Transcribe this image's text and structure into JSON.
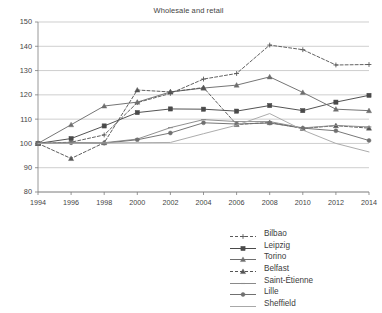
{
  "chart_data": {
    "type": "line",
    "title": "Wholesale and retail",
    "xlabel": "",
    "ylabel": "",
    "x": [
      1994,
      1996,
      1998,
      2000,
      2002,
      2004,
      2006,
      2008,
      2010,
      2012,
      2014
    ],
    "xtick_labels": [
      "1994",
      "1996",
      "1998",
      "2000",
      "2002",
      "2004",
      "2006",
      "2008",
      "2010",
      "2012",
      "2014"
    ],
    "ytick_labels": [
      "80",
      "90",
      "100",
      "110",
      "120",
      "130",
      "140",
      "150"
    ],
    "yticks": [
      80,
      90,
      100,
      110,
      120,
      130,
      140,
      150
    ],
    "ylim": [
      80,
      150
    ],
    "xlim": [
      1994,
      2014
    ],
    "grid": true,
    "legend_position": "bottom-right",
    "series": [
      {
        "name": "Bilbao",
        "color": "#5a5a5a",
        "dash": "3,2",
        "marker": "plus",
        "values": [
          100.0,
          100.5,
          103.5,
          116.8,
          120.6,
          126.5,
          128.8,
          140.5,
          138.6,
          132.3,
          132.5
        ]
      },
      {
        "name": "Leipzig",
        "color": "#4a4a4a",
        "dash": "none",
        "marker": "square",
        "values": [
          100.0,
          102.0,
          107.2,
          112.7,
          114.2,
          114.1,
          113.3,
          115.6,
          113.5,
          117.0,
          119.8
        ]
      },
      {
        "name": "Torino",
        "color": "#6e6e6e",
        "dash": "none",
        "marker": "triangle",
        "values": [
          100.0,
          107.7,
          115.4,
          117.0,
          121.2,
          122.8,
          124.0,
          127.4,
          121.0,
          114.1,
          113.5
        ]
      },
      {
        "name": "Belfast",
        "color": "#555555",
        "dash": "3,2",
        "marker": "triangle",
        "values": [
          100.0,
          93.8,
          100.3,
          122.0,
          121.2,
          123.0,
          107.8,
          108.6,
          106.2,
          107.3,
          106.3
        ]
      },
      {
        "name": "Saint-Étienne",
        "color": "#8a8a8a",
        "dash": "none",
        "marker": "dash",
        "values": [
          100.0,
          100.2,
          100.3,
          101.8,
          106.5,
          109.8,
          109.0,
          109.0,
          106.4,
          107.4,
          106.8
        ]
      },
      {
        "name": "Lille",
        "color": "#707070",
        "dash": "none",
        "marker": "circle",
        "values": [
          100.0,
          100.3,
          100.1,
          101.5,
          104.3,
          108.5,
          108.0,
          108.4,
          106.3,
          105.2,
          101.2
        ]
      },
      {
        "name": "Sheffield",
        "color": "#a8a8a8",
        "dash": "none",
        "marker": "none",
        "values": [
          100.0,
          100.1,
          100.2,
          100.3,
          100.4,
          104.0,
          107.5,
          112.3,
          105.5,
          100.0,
          96.5
        ]
      }
    ]
  }
}
